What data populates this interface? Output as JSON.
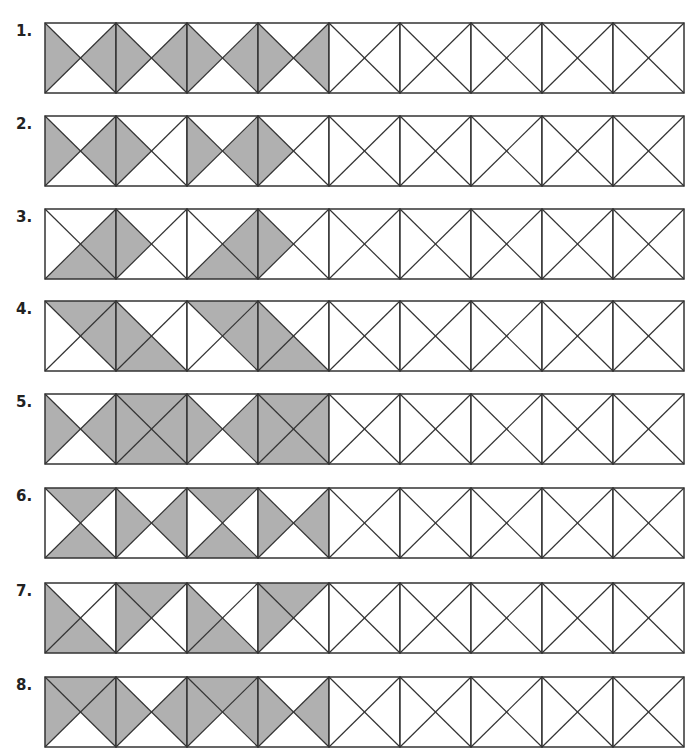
{
  "style": {
    "shade_color": "#b0b0b0",
    "line_color": "#333333"
  },
  "rows": [
    {
      "label": "1.",
      "top": 22,
      "squares": [
        [
          "L",
          "R"
        ],
        [
          "L",
          "R"
        ],
        [
          "L",
          "R"
        ],
        [
          "L",
          "R"
        ],
        [],
        [],
        [],
        [],
        []
      ]
    },
    {
      "label": "2.",
      "top": 115,
      "squares": [
        [
          "L",
          "R"
        ],
        [
          "L"
        ],
        [
          "L",
          "R"
        ],
        [
          "L"
        ],
        [],
        [],
        [],
        [],
        []
      ]
    },
    {
      "label": "3.",
      "top": 208,
      "squares": [
        [
          "B",
          "R"
        ],
        [
          "L"
        ],
        [
          "B",
          "R"
        ],
        [
          "L"
        ],
        [],
        [],
        [],
        [],
        []
      ]
    },
    {
      "label": "4.",
      "top": 300,
      "squares": [
        [
          "T",
          "R"
        ],
        [
          "L",
          "B"
        ],
        [
          "T",
          "R"
        ],
        [
          "L",
          "B"
        ],
        [],
        [],
        [],
        [],
        []
      ]
    },
    {
      "label": "5.",
      "top": 393,
      "squares": [
        [
          "L",
          "R"
        ],
        [
          "T",
          "B",
          "L",
          "R"
        ],
        [
          "L",
          "R"
        ],
        [
          "T",
          "B",
          "L",
          "R"
        ],
        [],
        [],
        [],
        [],
        []
      ]
    },
    {
      "label": "6.",
      "top": 487,
      "squares": [
        [
          "T",
          "B"
        ],
        [
          "L",
          "R"
        ],
        [
          "T",
          "B"
        ],
        [
          "L",
          "R"
        ],
        [],
        [],
        [],
        [],
        []
      ]
    },
    {
      "label": "7.",
      "top": 582,
      "squares": [
        [
          "L",
          "B"
        ],
        [
          "L",
          "T"
        ],
        [
          "L",
          "B"
        ],
        [
          "L",
          "T"
        ],
        [],
        [],
        [],
        [],
        []
      ]
    },
    {
      "label": "8.",
      "top": 676,
      "squares": [
        [
          "T",
          "L",
          "R"
        ],
        [
          "L",
          "R"
        ],
        [
          "T",
          "L",
          "R"
        ],
        [
          "L",
          "R"
        ],
        [],
        [],
        [],
        [],
        []
      ]
    }
  ]
}
